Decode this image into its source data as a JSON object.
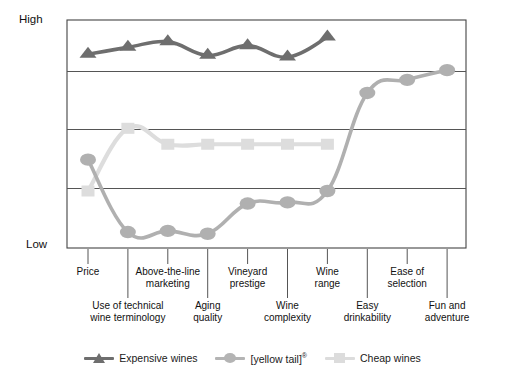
{
  "axis": {
    "y_high_label": "High",
    "y_low_label": "Low"
  },
  "legend": {
    "position": "bottom-center",
    "items": [
      {
        "label": "Expensive wines",
        "marker": "triangle-marker",
        "color": "#6e6e6e"
      },
      {
        "label": "[yellow tail]",
        "suffix": "®",
        "marker": "circle-marker",
        "color": "#b4b4b4"
      },
      {
        "label": "Cheap wines",
        "marker": "square-marker",
        "color": "#dcdcdc"
      }
    ]
  },
  "colors": {
    "expensive": "#6e6e6e",
    "yellowtail": "#b0b0b0",
    "cheap": "#dddddd",
    "axis": "#444444",
    "grid": "#555555"
  },
  "chart_data": {
    "type": "line",
    "title": "",
    "xlabel": "",
    "ylabel": "",
    "ylim": [
      0,
      4
    ],
    "ytick_labels": [
      "Low",
      "High"
    ],
    "grid": true,
    "legend_position": "bottom-center",
    "categories": [
      "Price",
      "Use of technical wine terminology",
      "Above-the-line marketing",
      "Aging quality",
      "Vineyard prestige",
      "Wine complexity",
      "Wine range",
      "Easy drinkability",
      "Ease of selection",
      "Fun and adventure"
    ],
    "category_rows": [
      {
        "label": "Price",
        "row": "top",
        "index": 0
      },
      {
        "label": "Use of technical\nwine terminology",
        "row": "bottom",
        "index": 1
      },
      {
        "label": "Above-the-line\nmarketing",
        "row": "top",
        "index": 2
      },
      {
        "label": "Aging\nquality",
        "row": "bottom",
        "index": 3
      },
      {
        "label": "Vineyard\nprestige",
        "row": "top",
        "index": 4
      },
      {
        "label": "Wine\ncomplexity",
        "row": "bottom",
        "index": 5
      },
      {
        "label": "Wine\nrange",
        "row": "top",
        "index": 6
      },
      {
        "label": "Easy\ndrinkability",
        "row": "bottom",
        "index": 7
      },
      {
        "label": "Ease of\nselection",
        "row": "top",
        "index": 8
      },
      {
        "label": "Fun and\nadventure",
        "row": "bottom",
        "index": 9
      }
    ],
    "series": [
      {
        "name": "Expensive wines",
        "marker": "triangle",
        "color": "#6e6e6e",
        "values": [
          3.4,
          3.52,
          3.62,
          3.38,
          3.55,
          3.35,
          3.7,
          null,
          null,
          null
        ]
      },
      {
        "name": "[yellow tail]",
        "marker": "circle",
        "color": "#b0b0b0",
        "values": [
          1.55,
          0.28,
          0.3,
          0.25,
          0.78,
          0.8,
          1.0,
          2.72,
          2.95,
          3.12
        ]
      },
      {
        "name": "Cheap wines",
        "marker": "square",
        "color": "#dddddd",
        "values": [
          1.0,
          2.1,
          1.82,
          1.82,
          1.82,
          1.82,
          1.82,
          null,
          null,
          null
        ]
      }
    ]
  }
}
